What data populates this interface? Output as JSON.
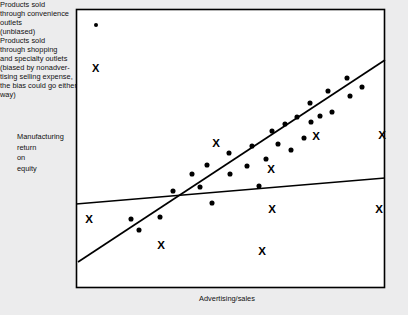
{
  "figure": {
    "axis_labels": {
      "y": "Manufacturing\nreturn\non\nequity",
      "x": "Advertising/sales"
    },
    "legend": {
      "entries": [
        {
          "marker": "filled-dot",
          "text": "Products sold\nthrough convenience\noutlets\n(unbiased)"
        },
        {
          "marker": "x-cross",
          "symbol": "X",
          "text": "Products sold\nthrough shopping\nand specialty outlets\n(biased by nonadver-\ntising selling expense,\nthe bias could go either\nway)"
        }
      ]
    },
    "colors": {
      "ink": "#000000",
      "plot_background": "#ffffff",
      "page_background": "#ececed"
    }
  },
  "chart_data": {
    "type": "scatter",
    "title": "",
    "xlabel": "Advertising/sales",
    "ylabel": "Manufacturing return on equity",
    "grid": false,
    "axis_ticks": false,
    "legend_position": "inside-top-left",
    "frame": {
      "x0": 76,
      "y0": 9,
      "x1": 385,
      "y1": 288
    },
    "series": [
      {
        "name": "Products sold through convenience outlets (unbiased)",
        "marker": "filled-dot",
        "points": [
          [
            131,
            219
          ],
          [
            139,
            230
          ],
          [
            160,
            217
          ],
          [
            173,
            191
          ],
          [
            192,
            174
          ],
          [
            200,
            187
          ],
          [
            207,
            165
          ],
          [
            212,
            203
          ],
          [
            229,
            153
          ],
          [
            230,
            174
          ],
          [
            247,
            166
          ],
          [
            252,
            146
          ],
          [
            259,
            186
          ],
          [
            266,
            159
          ],
          [
            272,
            131
          ],
          [
            278,
            144
          ],
          [
            285,
            124
          ],
          [
            291,
            150
          ],
          [
            297,
            117
          ],
          [
            304,
            138
          ],
          [
            310,
            103
          ],
          [
            311,
            122
          ],
          [
            320,
            116
          ],
          [
            328,
            91
          ],
          [
            332,
            112
          ],
          [
            347,
            78
          ],
          [
            350,
            96
          ],
          [
            362,
            87
          ]
        ]
      },
      {
        "name": "Products sold through shopping and specialty outlets (biased)",
        "marker": "x-cross",
        "points": [
          [
            89,
            219
          ],
          [
            161,
            245
          ],
          [
            216,
            143
          ],
          [
            262,
            251
          ],
          [
            271,
            169
          ],
          [
            272,
            209
          ],
          [
            316,
            136
          ],
          [
            379,
            209
          ],
          [
            382,
            135
          ]
        ]
      }
    ],
    "trend_lines": [
      {
        "name": "steep-regression-line",
        "description": "steep upward fit through convenience-outlet dots",
        "from": [
          78,
          262
        ],
        "to": [
          385,
          60
        ]
      },
      {
        "name": "flat-regression-line",
        "description": "shallow fit across all products",
        "from": [
          76,
          204
        ],
        "to": [
          385,
          178
        ]
      }
    ]
  }
}
